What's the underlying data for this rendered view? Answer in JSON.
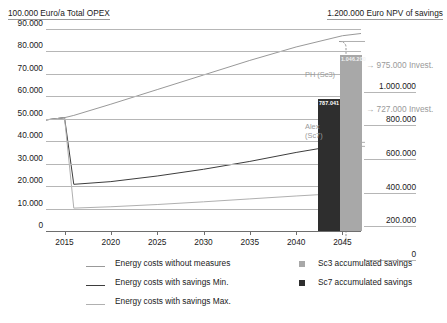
{
  "header": {
    "left": "100.000 Euro/a Total OPEX",
    "right": "1.200.000 Euro NPV of savings"
  },
  "chart_data": {
    "type": "line",
    "title": "",
    "xlabel": "",
    "ylabel": "100.000 Euro/a Total OPEX",
    "y2label": "1.200.000 Euro NPV of savings",
    "x": [
      2013,
      2015,
      2016,
      2020,
      2025,
      2030,
      2035,
      2040,
      2045,
      2047
    ],
    "xlim": [
      2013,
      2047
    ],
    "xticks": [
      "2015",
      "2020",
      "2025",
      "2030",
      "2035",
      "2040",
      "2045"
    ],
    "xtick_values": [
      2015,
      2020,
      2025,
      2030,
      2035,
      2040,
      2045
    ],
    "ylim": [
      0,
      90000
    ],
    "yticks": [
      "0",
      "10.000",
      "20.000",
      "30.000",
      "40.000",
      "50.000",
      "60.000",
      "70.000",
      "80.000",
      "90.000"
    ],
    "ytick_values": [
      0,
      10000,
      20000,
      30000,
      40000,
      50000,
      60000,
      70000,
      80000,
      90000
    ],
    "y2lim": [
      0,
      1200000
    ],
    "y2ticks": [
      "0",
      "200.000",
      "400.000",
      "600.000",
      "800.000",
      "1.000.000"
    ],
    "y2tick_values": [
      0,
      200000,
      400000,
      600000,
      800000,
      1000000
    ],
    "grid": true,
    "legend_position": "bottom",
    "series": [
      {
        "name": "Energy costs without measures",
        "color": "#999999",
        "type": "line",
        "values": [
          49500,
          50500,
          51500,
          56500,
          63000,
          69500,
          76000,
          82000,
          87000,
          88000
        ]
      },
      {
        "name": "Energy costs with savings Min.",
        "color": "#3d3d3d",
        "type": "line",
        "values": [
          49500,
          50500,
          20800,
          22000,
          24500,
          27500,
          31000,
          35000,
          38500,
          39500
        ]
      },
      {
        "name": "Energy costs with savings Max.",
        "color": "#b0b0b0",
        "type": "line",
        "values": [
          49500,
          50500,
          10200,
          10800,
          11800,
          13000,
          14300,
          15600,
          16800,
          17400
        ]
      }
    ],
    "bars": [
      {
        "name": "Sc7 accumulated savings",
        "label": "787.041",
        "value": 787041,
        "color": "#2e2e2e"
      },
      {
        "name": "Sc3 accumulated savings",
        "label": "1.046.200",
        "value": 1046200,
        "color": "#a8a8a8"
      }
    ],
    "annotations": [
      {
        "name": "ph-sc3-callout",
        "text": "PH (Sc3)"
      },
      {
        "name": "alex-sc7-callout",
        "text": "Alex\n(Sc7)"
      },
      {
        "name": "invest-975",
        "text": "975.000 Invest."
      },
      {
        "name": "invest-727",
        "text": "727.000 Invest."
      }
    ]
  },
  "legend": {
    "lines": [
      {
        "label": "Energy costs without measures",
        "color": "#999999"
      },
      {
        "label": "Energy costs with savings Min.",
        "color": "#3d3d3d"
      },
      {
        "label": "Energy costs with savings Max.",
        "color": "#b0b0b0"
      }
    ],
    "squares": [
      {
        "label": "Sc3 accumulated savings",
        "color": "#a8a8a8"
      },
      {
        "label": "Sc7 accumulated savings",
        "color": "#2e2e2e"
      }
    ]
  }
}
